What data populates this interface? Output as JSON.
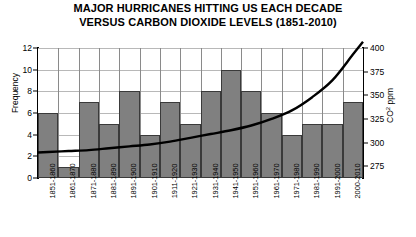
{
  "chart_data": {
    "type": "bar",
    "title": "MAJOR HURRICANES HITTING US EACH DECADE VERSUS CARBON DIOXIDE LEVELS (1851-2010)",
    "title_line1": "MAJOR HURRICANES HITTING US EACH DECADE",
    "title_line2": "VERSUS CARBON DIOXIDE LEVELS (1851-2010)",
    "xlabel": "",
    "ylabel": "Frequency",
    "ylabel_secondary": "CO² ppm",
    "ylabel_secondary_base": "CO",
    "ylabel_secondary_sup": "2",
    "ylabel_secondary_unit": " ppm",
    "ylim": [
      0,
      12
    ],
    "ylim_secondary": [
      262.5,
      400
    ],
    "yticks": [
      0,
      2,
      4,
      6,
      8,
      10,
      12
    ],
    "yticks_secondary": [
      275,
      300,
      325,
      350,
      375,
      400
    ],
    "grid": true,
    "legend": "none",
    "categories": [
      "1851-1860",
      "1861-1870",
      "1871-1880",
      "1881-1890",
      "1891-1900",
      "1901-1910",
      "1911-1920",
      "1921-1930",
      "1931-1940",
      "1941-1950",
      "1951-1960",
      "1961-1970",
      "1971-1980",
      "1981-1990",
      "1991-2000",
      "2000-2010"
    ],
    "series": [
      {
        "name": "Major hurricanes per decade",
        "type": "bar",
        "axis": "left",
        "color": "#808080",
        "values": [
          6,
          1,
          7,
          5,
          8,
          4,
          7,
          5,
          8,
          10,
          8,
          6,
          4,
          5,
          5,
          7
        ]
      },
      {
        "name": "CO² ppm",
        "type": "line",
        "axis": "right",
        "color": "#000000",
        "values": [
          290,
          291,
          292,
          294,
          296,
          298,
          301,
          305,
          309,
          313,
          318,
          325,
          334,
          348,
          366,
          393
        ]
      }
    ]
  }
}
